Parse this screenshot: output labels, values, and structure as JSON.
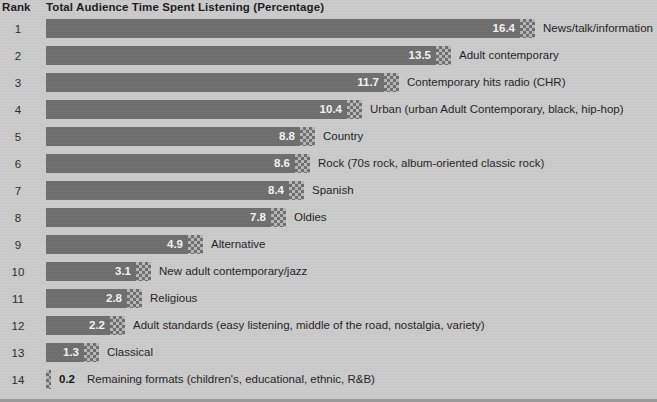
{
  "header": {
    "rank_label": "Rank",
    "title": "Total Audience Time Spent Listening (Percentage)"
  },
  "colors": {
    "page_background": "#cacaca",
    "bar_fill": "#6e6e6e",
    "bar_cap_light": "#b6b6b6",
    "value_text_inside": "#f2f2f2",
    "label_text": "#1f1f1f"
  },
  "chart_data": {
    "type": "bar",
    "title": "Total Audience Time Spent Listening (Percentage)",
    "orientation": "horizontal",
    "xlabel": "",
    "ylabel": "Rank",
    "xlim": [
      0,
      16.4
    ],
    "grid": false,
    "legend": null,
    "categories": [
      "News/talk/information",
      "Adult contemporary",
      "Contemporary hits radio (CHR)",
      "Urban (urban Adult Contemporary, black, hip-hop)",
      "Country",
      "Rock (70s rock, album-oriented classic rock)",
      "Spanish",
      "Oldies",
      "Alternative",
      "New adult contemporary/jazz",
      "Religious",
      "Adult standards (easy listening, middle of the road, nostalgia, variety)",
      "Classical",
      "Remaining formats (children's, educational, ethnic, R&B)"
    ],
    "values": [
      16.4,
      13.5,
      11.7,
      10.4,
      8.8,
      8.6,
      8.4,
      7.8,
      4.9,
      3.1,
      2.8,
      2.2,
      1.3,
      0.2
    ],
    "ranks": [
      1,
      2,
      3,
      4,
      5,
      6,
      7,
      8,
      9,
      10,
      11,
      12,
      13,
      14
    ]
  },
  "rows": [
    {
      "rank": "1",
      "value": "16.4",
      "label": "News/talk/information",
      "inside": true
    },
    {
      "rank": "2",
      "value": "13.5",
      "label": "Adult contemporary",
      "inside": true
    },
    {
      "rank": "3",
      "value": "11.7",
      "label": "Contemporary hits radio (CHR)",
      "inside": true
    },
    {
      "rank": "4",
      "value": "10.4",
      "label": "Urban (urban Adult Contemporary, black, hip-hop)",
      "inside": true
    },
    {
      "rank": "5",
      "value": "8.8",
      "label": "Country",
      "inside": true
    },
    {
      "rank": "6",
      "value": "8.6",
      "label": "Rock (70s rock, album-oriented classic rock)",
      "inside": true
    },
    {
      "rank": "7",
      "value": "8.4",
      "label": "Spanish",
      "inside": true
    },
    {
      "rank": "8",
      "value": "7.8",
      "label": "Oldies",
      "inside": true
    },
    {
      "rank": "9",
      "value": "4.9",
      "label": "Alternative",
      "inside": true
    },
    {
      "rank": "10",
      "value": "3.1",
      "label": "New adult contemporary/jazz",
      "inside": true
    },
    {
      "rank": "11",
      "value": "2.8",
      "label": "Religious",
      "inside": true
    },
    {
      "rank": "12",
      "value": "2.2",
      "label": "Adult standards (easy listening, middle of the road, nostalgia, variety)",
      "inside": true
    },
    {
      "rank": "13",
      "value": "1.3",
      "label": "Classical",
      "inside": true
    },
    {
      "rank": "14",
      "value": "0.2",
      "label": "Remaining formats (children's, educational, ethnic, R&B)",
      "inside": false
    }
  ]
}
